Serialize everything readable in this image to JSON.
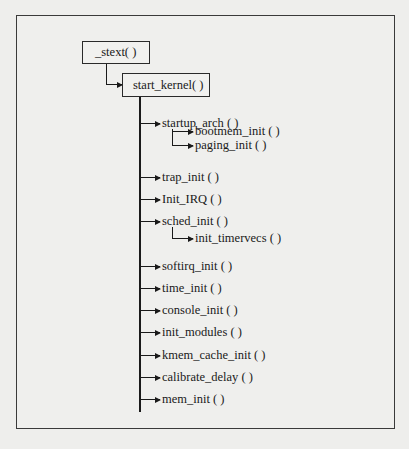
{
  "diagram": {
    "type": "call-tree",
    "root": {
      "label": "_stext( )",
      "child": {
        "label": "start_kernel( )",
        "calls": [
          {
            "label": "startup_arch ( )",
            "children": [
              "bootmem_init ( )",
              "paging_init ( )"
            ]
          },
          {
            "label": "trap_init ( )"
          },
          {
            "label": "Init_IRQ ( )"
          },
          {
            "label": "sched_init ( )",
            "children": [
              "init_timervecs ( )"
            ]
          },
          {
            "label": "softirq_init ( )"
          },
          {
            "label": "time_init ( )"
          },
          {
            "label": "console_init ( )"
          },
          {
            "label": "init_modules ( )"
          },
          {
            "label": "kmem_cache_init ( )"
          },
          {
            "label": "calibrate_delay ( )"
          },
          {
            "label": "mem_init ( )"
          }
        ]
      }
    }
  },
  "nodes": {
    "stext": "_stext( )",
    "start_kernel": "start_kernel( )",
    "startup_arch": "startup_arch ( )",
    "bootmem_init": "bootmem_init ( )",
    "paging_init": "paging_init ( )",
    "trap_init": "trap_init ( )",
    "init_irq": "Init_IRQ ( )",
    "sched_init": "sched_init ( )",
    "init_timervecs": "init_timervecs ( )",
    "softirq_init": "softirq_init ( )",
    "time_init": "time_init ( )",
    "console_init": "console_init ( )",
    "init_modules": "init_modules ( )",
    "kmem_cache_init": "kmem_cache_init ( )",
    "calibrate_delay": "calibrate_delay ( )",
    "mem_init": "mem_init ( )"
  },
  "colors": {
    "background": "#eeeeec",
    "line": "#1a1a1a",
    "border": "#2a2a2a"
  }
}
